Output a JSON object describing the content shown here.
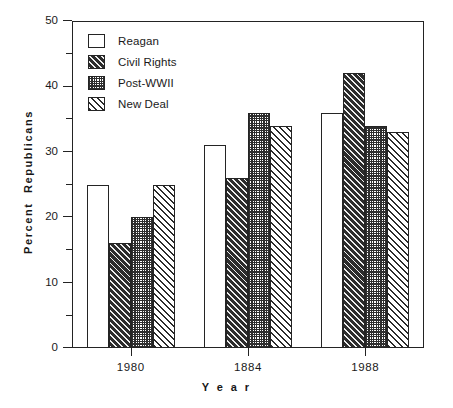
{
  "chart_data": {
    "type": "bar",
    "title": "",
    "xlabel": "Y e a r",
    "ylabel": "Percent  Republicans",
    "categories": [
      "1980",
      "1884",
      "1988"
    ],
    "ylim": [
      0,
      50
    ],
    "y_major_ticks": [
      0,
      10,
      20,
      30,
      40,
      50
    ],
    "y_minor_ticks": [
      5,
      15,
      25,
      35,
      45
    ],
    "y_tick_labels": [
      "0",
      "10",
      "20",
      "30",
      "40",
      "50"
    ],
    "grid": false,
    "legend_position": "top-left",
    "series": [
      {
        "name": "Reagan",
        "pattern": "solid-white",
        "values": [
          25,
          31,
          36
        ]
      },
      {
        "name": "Civil Rights",
        "pattern": "dark-diagonal",
        "values": [
          16,
          26,
          42
        ]
      },
      {
        "name": "Post-WWII",
        "pattern": "dark-crosshatch",
        "values": [
          20,
          36,
          34
        ]
      },
      {
        "name": "New Deal",
        "pattern": "white-diagonal",
        "values": [
          25,
          34,
          33
        ]
      }
    ]
  },
  "axis": {
    "x_title": "Y e a r",
    "y_title": "Percent  Republicans"
  },
  "legend": {
    "items": [
      {
        "label": "Reagan"
      },
      {
        "label": "Civil Rights"
      },
      {
        "label": "Post-WWII"
      },
      {
        "label": "New Deal"
      }
    ]
  },
  "colors": {
    "axis": "#232323",
    "bar_outline": "#242424",
    "dark_fill": "#2c2c2c",
    "background": "#ffffff"
  }
}
